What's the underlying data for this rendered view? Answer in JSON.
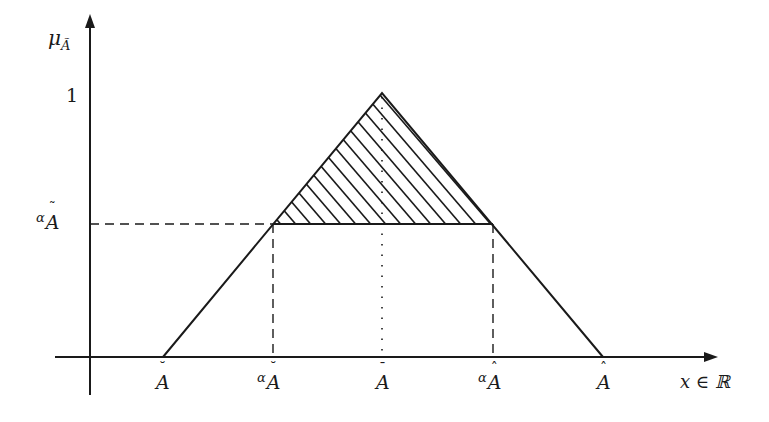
{
  "diagram": {
    "y_axis": {
      "label": "μ",
      "label_subscript": "Ã",
      "tick_one": "1",
      "tick_alpha_prefix": "α",
      "tick_alpha_base": "A",
      "tick_alpha_accent": "˜"
    },
    "x_axis": {
      "label": "x ∈ ℝ"
    },
    "x_ticks": [
      {
        "prefix": "",
        "base": "A",
        "accent": "˘"
      },
      {
        "prefix": "α",
        "base": "A",
        "accent": "˘"
      },
      {
        "prefix": "",
        "base": "A",
        "accent": "¯"
      },
      {
        "prefix": "α",
        "base": "A",
        "accent": "ˆ"
      },
      {
        "prefix": "",
        "base": "A",
        "accent": "ˆ"
      }
    ],
    "colors": {
      "stroke": "#1a1a1a",
      "background": "#ffffff"
    }
  }
}
